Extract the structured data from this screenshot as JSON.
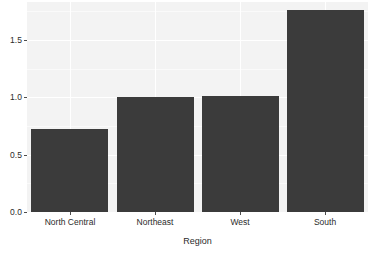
{
  "chart_data": {
    "type": "bar",
    "title": "",
    "subtitle": "",
    "xlabel": "Region",
    "ylabel": "",
    "categories": [
      "North Central",
      "Northeast",
      "West",
      "South"
    ],
    "values": [
      0.72,
      1.0,
      1.01,
      1.76
    ],
    "ylim": [
      0.0,
      1.83
    ],
    "xlim_note": "categorical, 4 evenly spaced bars",
    "yticks": [
      "0.0",
      "0.5",
      "1.0",
      "1.5"
    ],
    "ytick_values": [
      0.0,
      0.5,
      1.0,
      1.5
    ],
    "grid": true,
    "grid_color": "#ffffff",
    "legend": "none",
    "bar_color": "#3b3b3b",
    "panel_background": "#f3f3f3",
    "figure_background": "#ffffff",
    "axis_text_color": "#2b2b2b"
  },
  "axes": {
    "y": {
      "ticks": [
        {
          "label": "0.0",
          "value": 0.0
        },
        {
          "label": "0.5",
          "value": 0.5
        },
        {
          "label": "1.0",
          "value": 1.0
        },
        {
          "label": "1.5",
          "value": 1.5
        }
      ]
    },
    "x": {
      "title": "Region",
      "ticks": [
        {
          "label": "North Central"
        },
        {
          "label": "Northeast"
        },
        {
          "label": "West"
        },
        {
          "label": "South"
        }
      ]
    }
  }
}
